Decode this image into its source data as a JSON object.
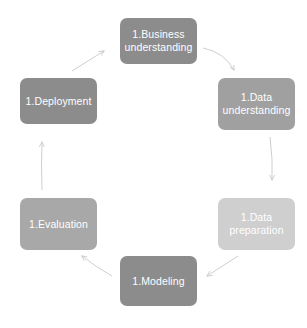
{
  "diagram": {
    "background_color": "#ffffff",
    "arrow_color": "#c8c8c8",
    "text_color": "#ffffff",
    "nodes": [
      {
        "id": "business-understanding",
        "label": "1.Business\nunderstanding",
        "color": "#8c8c8c",
        "x": 120,
        "y": 18,
        "w": 77,
        "h": 46
      },
      {
        "id": "data-understanding",
        "label": "1.Data\nunderstanding",
        "color": "#a0a0a0",
        "x": 218,
        "y": 78,
        "w": 77,
        "h": 52
      },
      {
        "id": "data-preparation",
        "label": "1.Data\npreparation",
        "color": "#cfcfcf",
        "x": 218,
        "y": 198,
        "w": 77,
        "h": 52
      },
      {
        "id": "modeling",
        "label": "1.Modeling",
        "color": "#8c8c8c",
        "x": 120,
        "y": 256,
        "w": 77,
        "h": 50
      },
      {
        "id": "evaluation",
        "label": "1.Evaluation",
        "color": "#a8a8a8",
        "x": 20,
        "y": 198,
        "w": 77,
        "h": 52
      },
      {
        "id": "deployment",
        "label": "1.Deployment",
        "color": "#8c8c8c",
        "x": 20,
        "y": 78,
        "w": 77,
        "h": 46
      }
    ],
    "arrows": [
      {
        "id": "arrow-business-to-data-understanding",
        "from": "business-understanding",
        "to": "data-understanding"
      },
      {
        "id": "arrow-data-understanding-to-data-preparation",
        "from": "data-understanding",
        "to": "data-preparation"
      },
      {
        "id": "arrow-data-preparation-to-modeling",
        "from": "data-preparation",
        "to": "modeling"
      },
      {
        "id": "arrow-modeling-to-evaluation",
        "from": "modeling",
        "to": "evaluation"
      },
      {
        "id": "arrow-evaluation-to-deployment",
        "from": "evaluation",
        "to": "deployment"
      },
      {
        "id": "arrow-deployment-to-business",
        "from": "deployment",
        "to": "business-understanding"
      }
    ]
  }
}
